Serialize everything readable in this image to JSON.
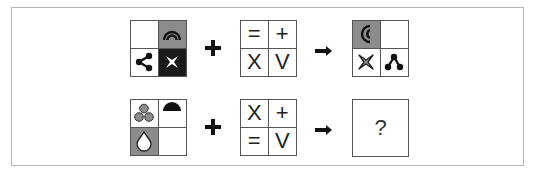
{
  "puzzle": {
    "colors": {
      "white": "#ffffff",
      "grey": "#8c8c8c",
      "black": "#1a1a1a",
      "border": "#555555",
      "frame": "#b5b5b5"
    },
    "rows": [
      {
        "input_grid": [
          {
            "pos": "tl",
            "bg": "white",
            "icon": "empty"
          },
          {
            "pos": "tr",
            "bg": "grey",
            "icon": "double-arc-icon"
          },
          {
            "pos": "bl",
            "bg": "white",
            "icon": "share-nodes-icon"
          },
          {
            "pos": "br",
            "bg": "black",
            "icon": "four-point-star-icon"
          }
        ],
        "operator": "+",
        "rule_grid": [
          {
            "pos": "tl",
            "symbol": "="
          },
          {
            "pos": "tr",
            "symbol": "+"
          },
          {
            "pos": "bl",
            "symbol": "X"
          },
          {
            "pos": "br",
            "symbol": "V"
          }
        ],
        "arrow": "→",
        "output_grid": [
          {
            "pos": "tl",
            "bg": "grey",
            "icon": "double-crescent-icon"
          },
          {
            "pos": "tr",
            "bg": "white",
            "icon": "empty"
          },
          {
            "pos": "bl",
            "bg": "white",
            "icon": "four-point-star-icon"
          },
          {
            "pos": "br",
            "bg": "white",
            "icon": "share-nodes-up-icon"
          }
        ]
      },
      {
        "input_grid": [
          {
            "pos": "tl",
            "bg": "white",
            "icon": "three-circles-icon"
          },
          {
            "pos": "tr",
            "bg": "white",
            "icon": "half-circle-icon"
          },
          {
            "pos": "bl",
            "bg": "grey",
            "icon": "droplet-icon"
          },
          {
            "pos": "br",
            "bg": "white",
            "icon": "empty"
          }
        ],
        "operator": "+",
        "rule_grid": [
          {
            "pos": "tl",
            "symbol": "X"
          },
          {
            "pos": "tr",
            "symbol": "+"
          },
          {
            "pos": "bl",
            "symbol": "="
          },
          {
            "pos": "br",
            "symbol": "V"
          }
        ],
        "arrow": "→",
        "answer": "?"
      }
    ]
  }
}
